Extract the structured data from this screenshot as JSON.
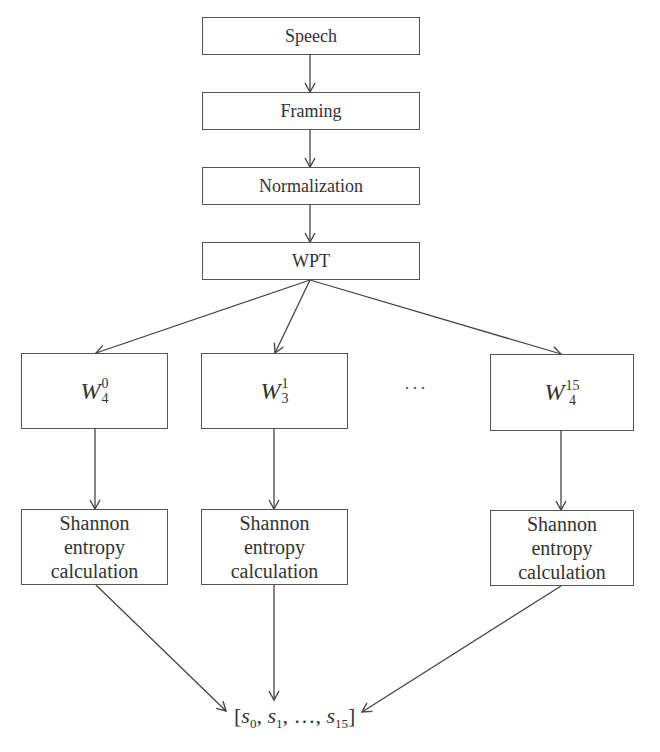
{
  "diagram": {
    "pipeline": [
      {
        "id": "speech",
        "label": "Speech"
      },
      {
        "id": "framing",
        "label": "Framing"
      },
      {
        "id": "normalization",
        "label": "Normalization"
      },
      {
        "id": "wpt",
        "label": "WPT"
      }
    ],
    "wavelet_nodes": [
      {
        "id": "w4-0",
        "base": "W",
        "subscript": "4",
        "superscript": "0"
      },
      {
        "id": "w3-1",
        "base": "W",
        "subscript": "3",
        "superscript": "1"
      },
      {
        "id": "w4-15",
        "base": "W",
        "subscript": "4",
        "superscript": "15"
      }
    ],
    "ellipsis": "···",
    "entropy_label": [
      "Shannon",
      "entropy",
      "calculation"
    ],
    "output": {
      "open": "[",
      "items": [
        {
          "base": "s",
          "sub": "0"
        },
        {
          "base": "s",
          "sub": "1"
        },
        {
          "base": "…",
          "sub": ""
        },
        {
          "base": "s",
          "sub": "15"
        }
      ],
      "close": "]",
      "text": "[s0, s1, ..., s15]"
    },
    "colors": {
      "stroke": "#555555",
      "text": "#333333",
      "background": "#ffffff"
    }
  }
}
